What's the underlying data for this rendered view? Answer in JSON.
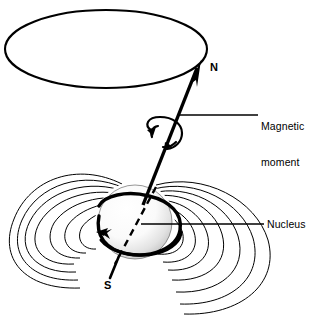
{
  "figure": {
    "background_color": "#ffffff",
    "ink_color": "#000000",
    "width": 320,
    "height": 323
  },
  "labels": {
    "north_pole": "N",
    "south_pole": "S",
    "magnetic_moment_line1": "Magnetic",
    "magnetic_moment_line2": "moment",
    "nucleus": "Nucleus"
  },
  "elements": {
    "precession_ellipse": "precession-cone-ellipse",
    "moment_vector": "magnetic-moment-vector-arrow",
    "spin_arrow": "precession-rotation-arrow",
    "nucleus_sphere": "stippled-nucleus-sphere",
    "spin_axis": "dashed-spin-axis",
    "field_lines_left": "magnetic-field-loops-left",
    "field_lines_right": "magnetic-field-loops-right",
    "leader_magnetic_moment": "leader-line-magnetic-moment",
    "leader_nucleus": "leader-line-nucleus"
  },
  "geometry": {
    "ellipse_center_x": 106,
    "ellipse_center_y": 49,
    "ellipse_rx": 101,
    "ellipse_ry": 39,
    "nucleus_center_x": 135,
    "nucleus_center_y": 222,
    "nucleus_radius": 37,
    "vector_tip_x": 200,
    "vector_tip_y": 62,
    "vector_tail_x": 113,
    "vector_tail_y": 275
  }
}
